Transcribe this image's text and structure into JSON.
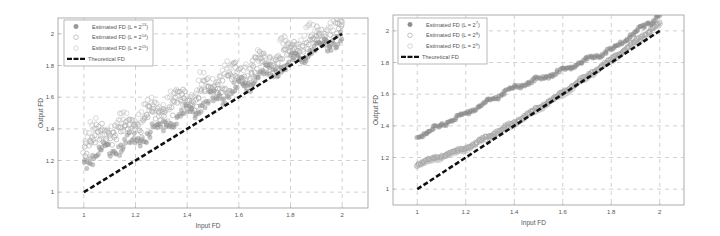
{
  "chart_data": [
    {
      "type": "scatter",
      "title": "",
      "xlabel": "Input FD",
      "ylabel": "Output FD",
      "xlim": [
        0.9,
        2.1
      ],
      "ylim": [
        0.9,
        2.1
      ],
      "xticks": [
        "1",
        "1.2",
        "1.4",
        "1.6",
        "1.8",
        "2"
      ],
      "xtick_values": [
        1,
        1.2,
        1.4,
        1.6,
        1.8,
        2
      ],
      "yticks": [
        "1",
        "1.2",
        "1.4",
        "1.6",
        "1.8",
        "2"
      ],
      "ytick_values": [
        1,
        1.2,
        1.4,
        1.6,
        1.8,
        2
      ],
      "grid": true,
      "legend_position": "upper left",
      "series": [
        {
          "name": "Estimated FD (L = 2^13)",
          "label_base": "Estimated FD (L = 2",
          "label_sup": "13",
          "marker": "filled-circle",
          "color": "#9a9a9a",
          "x": [
            1.0,
            1.2,
            1.4,
            1.6,
            1.8,
            2.0
          ],
          "values": [
            1.2,
            1.33,
            1.5,
            1.66,
            1.82,
            1.98
          ],
          "noise": 0.05
        },
        {
          "name": "Estimated FD (L = 2^14)",
          "label_base": "Estimated FD (L = 2",
          "label_sup": "14",
          "marker": "open-circle",
          "color": "#b0b0b0",
          "x": [
            1.0,
            1.2,
            1.4,
            1.6,
            1.8,
            2.0
          ],
          "values": [
            1.3,
            1.42,
            1.58,
            1.74,
            1.88,
            2.04
          ],
          "noise": 0.08
        },
        {
          "name": "Estimated FD (L = 2^15)",
          "label_base": "Estimated FD (L = 2",
          "label_sup": "15",
          "marker": "open-circle",
          "color": "#c8c8c8",
          "x": [
            1.0,
            1.2,
            1.4,
            1.6,
            1.8,
            2.0
          ],
          "values": [
            1.34,
            1.46,
            1.62,
            1.77,
            1.91,
            2.06
          ],
          "noise": 0.08
        },
        {
          "name": "Theoretical FD",
          "label_base": "Theoretical FD",
          "label_sup": "",
          "marker": "dashed-line",
          "color": "#111111",
          "x": [
            1.0,
            2.0
          ],
          "values": [
            1.0,
            2.0
          ]
        }
      ]
    },
    {
      "type": "scatter",
      "title": "",
      "xlabel": "Input FD",
      "ylabel": "Output FD",
      "xlim": [
        0.9,
        2.1
      ],
      "ylim": [
        0.9,
        2.1
      ],
      "xticks": [
        "1",
        "1.2",
        "1.4",
        "1.6",
        "1.8",
        "2"
      ],
      "xtick_values": [
        1,
        1.2,
        1.4,
        1.6,
        1.8,
        2
      ],
      "yticks": [
        "1",
        "1.2",
        "1.4",
        "1.6",
        "1.8",
        "2"
      ],
      "ytick_values": [
        1,
        1.2,
        1.4,
        1.6,
        1.8,
        2
      ],
      "grid": true,
      "legend_position": "upper left",
      "series": [
        {
          "name": "Estimated FD (L = 2^7)",
          "label_base": "Estimated FD (L = 2",
          "label_sup": "7",
          "marker": "filled-circle",
          "color": "#8f8f8f",
          "x": [
            1.0,
            1.2,
            1.4,
            1.6,
            1.8,
            2.0
          ],
          "values": [
            1.33,
            1.48,
            1.64,
            1.75,
            1.88,
            2.1
          ],
          "noise": 0.015
        },
        {
          "name": "Estimated FD (L = 2^8)",
          "label_base": "Estimated FD (L = 2",
          "label_sup": "8",
          "marker": "open-circle",
          "color": "#a8a8a8",
          "x": [
            1.0,
            1.2,
            1.4,
            1.6,
            1.8,
            2.0
          ],
          "values": [
            1.16,
            1.26,
            1.42,
            1.61,
            1.82,
            2.05
          ],
          "noise": 0.01
        },
        {
          "name": "Estimated FD (L = 2^9)",
          "label_base": "Estimated FD (L = 2",
          "label_sup": "9",
          "marker": "open-circle",
          "color": "#c4c4c4",
          "x": [
            1.0,
            1.2,
            1.4,
            1.6,
            1.8,
            2.0
          ],
          "values": [
            1.15,
            1.25,
            1.41,
            1.6,
            1.81,
            2.04
          ],
          "noise": 0.01
        },
        {
          "name": "Theoretical FD",
          "label_base": "Theoretical FD",
          "label_sup": "",
          "marker": "dashed-line",
          "color": "#111111",
          "x": [
            1.0,
            2.0
          ],
          "values": [
            1.0,
            2.0
          ]
        }
      ]
    }
  ],
  "layout": {
    "panels": [
      {
        "axes": {
          "x0": 58,
          "y0": 18,
          "x1": 368,
          "y1": 208
        },
        "legend": {
          "x": 64,
          "y": 20,
          "w": 89,
          "h": 46
        }
      },
      {
        "axes": {
          "x0": 23,
          "y0": 15,
          "x1": 314,
          "y1": 205
        },
        "legend": {
          "x": 28,
          "y": 18,
          "w": 89,
          "h": 46
        }
      }
    ],
    "grid_color": "#bdbdbd",
    "axes_color": "#9a9a9a"
  }
}
